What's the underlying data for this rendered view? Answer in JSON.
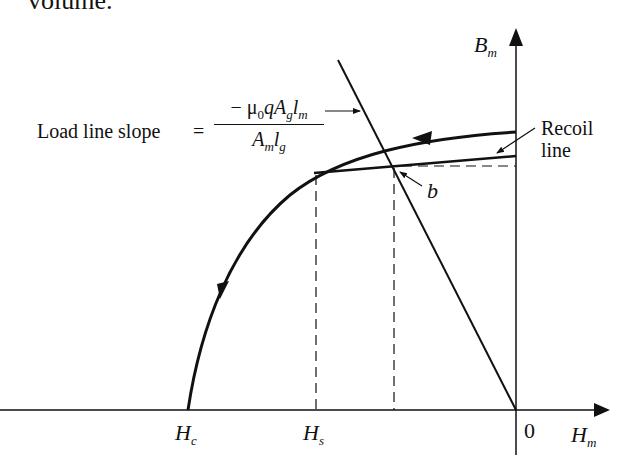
{
  "page": {
    "top_partial_text": "volume."
  },
  "diagram": {
    "type": "magnetization-curve",
    "axes": {
      "y_label_main": "B",
      "y_label_sub": "m",
      "x_label_main": "H",
      "x_label_sub": "m",
      "origin_label": "0"
    },
    "x_ticks": [
      {
        "main": "H",
        "sub": "c"
      },
      {
        "main": "H",
        "sub": "s"
      }
    ],
    "annotations": {
      "load_line_text": "Load line slope",
      "equals": "=",
      "numerator_prefix": "− μ",
      "numerator_mu_sub": "0",
      "numerator_q": "qA",
      "numerator_g_sub": "g",
      "numerator_l": "l",
      "numerator_m_sub": "m",
      "denominator_A": "A",
      "denominator_m_sub": "m",
      "denominator_l": "l",
      "denominator_g_sub": "g",
      "recoil_line_1": "Recoil",
      "recoil_line_2": "line",
      "point_b": "b"
    },
    "colors": {
      "stroke": "#111111",
      "background": "#ffffff"
    }
  }
}
